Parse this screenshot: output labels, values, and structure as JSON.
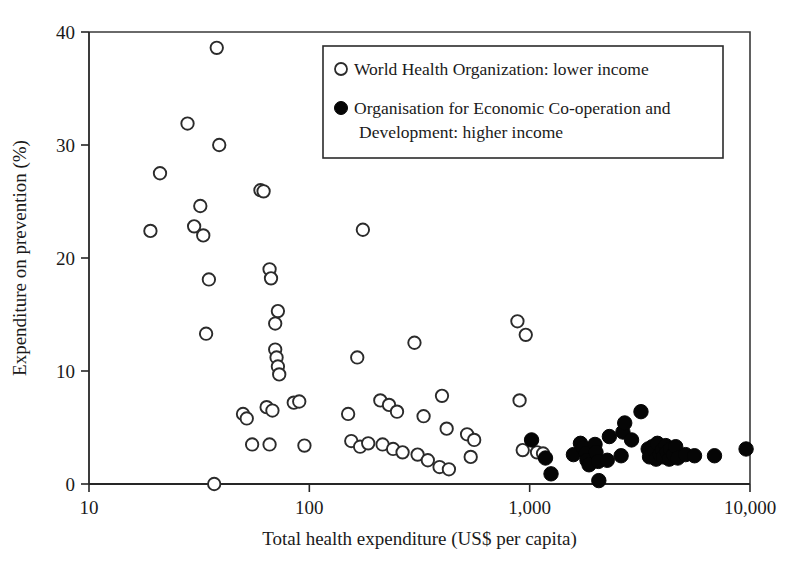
{
  "chart_data": {
    "type": "scatter",
    "title": "",
    "xlabel": "Total health expenditure (US$ per capita)",
    "ylabel": "Expenditure on prevention (%)",
    "x_scale": "log",
    "xlim": [
      10,
      10000
    ],
    "ylim": [
      0,
      40
    ],
    "x_ticks": [
      10,
      100,
      1000,
      10000
    ],
    "x_tick_labels": [
      "10",
      "100",
      "1,000",
      "10,000"
    ],
    "y_ticks": [
      0,
      10,
      20,
      30,
      40
    ],
    "y_tick_labels": [
      "0",
      "10",
      "20",
      "30",
      "40"
    ],
    "grid": false,
    "legend_position": "top-right",
    "series": [
      {
        "name": "World Health Organization: lower income",
        "marker": "open-circle",
        "color": "#ffffff",
        "edge_color": "#2b2b2b",
        "points": [
          [
            19,
            22.4
          ],
          [
            21,
            27.5
          ],
          [
            28,
            31.9
          ],
          [
            30,
            22.8
          ],
          [
            32,
            24.6
          ],
          [
            33,
            22.0
          ],
          [
            38,
            38.6
          ],
          [
            39,
            30.0
          ],
          [
            35,
            18.1
          ],
          [
            34,
            13.3
          ],
          [
            60,
            26.0
          ],
          [
            62,
            25.9
          ],
          [
            37,
            0.0
          ],
          [
            50,
            6.2
          ],
          [
            52,
            5.8
          ],
          [
            55,
            3.5
          ],
          [
            66,
            19.0
          ],
          [
            67,
            18.2
          ],
          [
            70,
            14.2
          ],
          [
            72,
            15.3
          ],
          [
            70,
            11.9
          ],
          [
            71,
            11.2
          ],
          [
            72,
            10.4
          ],
          [
            73,
            9.7
          ],
          [
            64,
            6.8
          ],
          [
            68,
            6.5
          ],
          [
            66,
            3.5
          ],
          [
            85,
            7.2
          ],
          [
            90,
            7.3
          ],
          [
            95,
            3.4
          ],
          [
            150,
            6.2
          ],
          [
            165,
            11.2
          ],
          [
            175,
            22.5
          ],
          [
            155,
            3.8
          ],
          [
            170,
            3.3
          ],
          [
            185,
            3.6
          ],
          [
            210,
            7.4
          ],
          [
            230,
            7.0
          ],
          [
            250,
            6.4
          ],
          [
            215,
            3.5
          ],
          [
            240,
            3.1
          ],
          [
            265,
            2.8
          ],
          [
            300,
            12.5
          ],
          [
            330,
            6.0
          ],
          [
            310,
            2.6
          ],
          [
            345,
            2.1
          ],
          [
            400,
            7.8
          ],
          [
            420,
            4.9
          ],
          [
            390,
            1.5
          ],
          [
            430,
            1.3
          ],
          [
            520,
            4.4
          ],
          [
            560,
            3.9
          ],
          [
            540,
            2.4
          ],
          [
            880,
            14.4
          ],
          [
            960,
            13.2
          ],
          [
            900,
            7.4
          ],
          [
            930,
            3.0
          ],
          [
            1080,
            2.8
          ],
          [
            1150,
            2.7
          ]
        ]
      },
      {
        "name": "Organisation for Economic Co-operation and Development: higher income",
        "marker": "filled-circle",
        "color": "#050505",
        "edge_color": "#050505",
        "points": [
          [
            1020,
            3.9
          ],
          [
            1180,
            2.3
          ],
          [
            1250,
            0.9
          ],
          [
            1580,
            2.6
          ],
          [
            1700,
            3.6
          ],
          [
            1750,
            3.2
          ],
          [
            1800,
            2.7
          ],
          [
            1820,
            2.1
          ],
          [
            1860,
            1.7
          ],
          [
            1980,
            3.5
          ],
          [
            2000,
            2.8
          ],
          [
            2050,
            2.0
          ],
          [
            2060,
            0.3
          ],
          [
            2250,
            2.1
          ],
          [
            2300,
            4.2
          ],
          [
            2600,
            2.5
          ],
          [
            2650,
            4.6
          ],
          [
            2700,
            5.4
          ],
          [
            2900,
            3.9
          ],
          [
            3200,
            6.4
          ],
          [
            3450,
            3.1
          ],
          [
            3500,
            2.4
          ],
          [
            3600,
            3.3
          ],
          [
            3700,
            2.9
          ],
          [
            3750,
            2.2
          ],
          [
            3800,
            3.6
          ],
          [
            3900,
            2.6
          ],
          [
            4000,
            3.0
          ],
          [
            4050,
            2.4
          ],
          [
            4150,
            3.4
          ],
          [
            4200,
            2.8
          ],
          [
            4300,
            2.2
          ],
          [
            4350,
            3.1
          ],
          [
            4500,
            2.6
          ],
          [
            4600,
            3.3
          ],
          [
            4700,
            2.3
          ],
          [
            5100,
            2.6
          ],
          [
            5600,
            2.5
          ],
          [
            6900,
            2.5
          ],
          [
            9600,
            3.1
          ]
        ]
      }
    ]
  },
  "legend": {
    "entries": [
      {
        "label": "World Health Organization: lower income",
        "marker": "open-circle"
      },
      {
        "label": "Organisation for Economic Co-operation and",
        "label2": "Development: higher income",
        "marker": "filled-circle"
      }
    ]
  }
}
